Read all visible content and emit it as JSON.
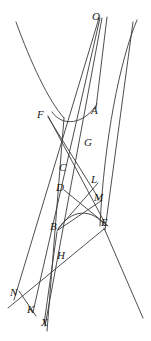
{
  "figure": {
    "type": "geometry-diagram",
    "width": 151,
    "height": 341,
    "background_color": "#ffffff",
    "stroke_color": "#3a3a3a",
    "label_color": "#1a1a1a",
    "label_style": "italic-serif",
    "label_font_size_px": 11
  },
  "labels": [
    {
      "id": "O",
      "text": "O",
      "x": 92,
      "y": 11
    },
    {
      "id": "F",
      "text": "F",
      "x": 37,
      "y": 109
    },
    {
      "id": "A",
      "text": "A",
      "x": 91,
      "y": 105
    },
    {
      "id": "G",
      "text": "G",
      "x": 84,
      "y": 137
    },
    {
      "id": "C",
      "text": "C",
      "x": 59,
      "y": 162
    },
    {
      "id": "L",
      "text": "L",
      "x": 91,
      "y": 174
    },
    {
      "id": "D",
      "text": "D",
      "x": 56,
      "y": 182
    },
    {
      "id": "M",
      "text": "M",
      "x": 94,
      "y": 192
    },
    {
      "id": "B",
      "text": "B",
      "x": 50,
      "y": 221
    },
    {
      "id": "E",
      "text": "E",
      "x": 101,
      "y": 217
    },
    {
      "id": "H",
      "text": "H",
      "x": 57,
      "y": 250
    },
    {
      "id": "N",
      "text": "N",
      "x": 10,
      "y": 287
    },
    {
      "id": "K",
      "text": "K",
      "x": 27,
      "y": 304
    },
    {
      "id": "X",
      "text": "X",
      "x": 41,
      "y": 317
    }
  ],
  "curves": [
    {
      "id": "upper-conic-left-branch",
      "kind": "arc",
      "path": "M 16 22 C 31 63 48 100 64 118"
    },
    {
      "id": "upper-conic-vertex-arc",
      "kind": "arc",
      "path": "M 52 112 C 62 127 84 125 97 104"
    },
    {
      "id": "lower-conic-right-branch",
      "kind": "arc",
      "path": "M 137 20 C 120 60 104 140 100 226"
    },
    {
      "id": "lower-conic-vertex-arc",
      "kind": "arc",
      "path": "M 57 231 C 70 208 93 208 105 226"
    }
  ],
  "lines": [
    {
      "id": "O-to-N",
      "from": "O",
      "to": "N",
      "x1": 99,
      "y1": 18,
      "x2": 14,
      "y2": 300
    },
    {
      "id": "O-to-K",
      "from": "O",
      "to": "K",
      "x1": 100,
      "y1": 18,
      "x2": 33,
      "y2": 312
    },
    {
      "id": "O-to-X",
      "from": "O",
      "to": "X",
      "x1": 102,
      "y1": 18,
      "x2": 45,
      "y2": 326
    },
    {
      "id": "F-to-E",
      "from": "F",
      "to": "E",
      "x1": 48,
      "y1": 116,
      "x2": 106,
      "y2": 225
    },
    {
      "id": "F-to-M",
      "from": "F",
      "to": "M",
      "x1": 48,
      "y1": 117,
      "x2": 99,
      "y2": 199
    },
    {
      "id": "left-long-descender",
      "from": "top-left",
      "to": "bottom",
      "x1": 64,
      "y1": 118,
      "x2": 47,
      "y2": 331
    },
    {
      "id": "A-upper-ray",
      "from": "O-region",
      "to": "A",
      "x1": 107,
      "y1": 17,
      "x2": 96,
      "y2": 108
    },
    {
      "id": "right-outer-ray",
      "from": "top-right",
      "to": "bottom-right",
      "x1": 133,
      "y1": 22,
      "x2": 105,
      "y2": 230
    },
    {
      "id": "E-to-bottom-right",
      "from": "E",
      "to": "bottom-right",
      "x1": 104,
      "y1": 228,
      "x2": 143,
      "y2": 318
    },
    {
      "id": "D-to-E",
      "from": "D",
      "to": "E",
      "x1": 64,
      "y1": 190,
      "x2": 108,
      "y2": 226
    },
    {
      "id": "B-to-L",
      "from": "B",
      "to": "L",
      "x1": 58,
      "y1": 229,
      "x2": 98,
      "y2": 183
    },
    {
      "id": "B-to-M",
      "from": "B",
      "to": "M",
      "x1": 58,
      "y1": 230,
      "x2": 101,
      "y2": 201
    },
    {
      "id": "N-to-K",
      "from": "N",
      "to": "K",
      "x1": 19,
      "y1": 291,
      "x2": 36,
      "y2": 316
    },
    {
      "id": "B-to-X",
      "from": "B",
      "to": "X",
      "x1": 57,
      "y1": 232,
      "x2": 44,
      "y2": 324
    },
    {
      "id": "E-to-N-diagonal",
      "from": "E",
      "to": "N",
      "x1": 104,
      "y1": 229,
      "x2": 8,
      "y2": 308
    }
  ]
}
